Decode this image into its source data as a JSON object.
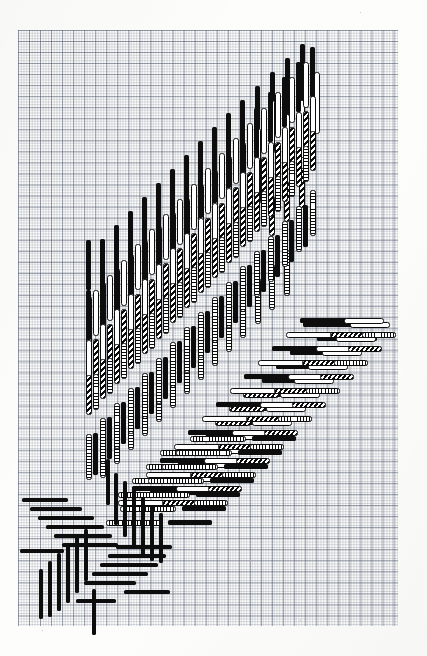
{
  "figure": {
    "title": "",
    "media": "graph-paper-scan",
    "background_color": "#fdfdfc",
    "grid": {
      "major_line_color": "#46506480",
      "minor_line_color": "#5a6478",
      "major_cell_px": 11.05,
      "minor_cell_px": 2.76,
      "left": 18,
      "top": 30,
      "width": 380,
      "height": 596,
      "cols_major": 34,
      "rows_major": 54
    },
    "ink_color": "#0d0d0d",
    "fill_styles": [
      {
        "id": "f-solid",
        "name": "solid-black"
      },
      {
        "id": "f-hollow",
        "name": "hollow-outline"
      },
      {
        "id": "f-hatch",
        "name": "diagonal-hatched"
      },
      {
        "id": "f-seg-v",
        "name": "segmented-ladder-vertical"
      },
      {
        "id": "f-seg-h",
        "name": "segmented-ladder-horizontal"
      }
    ]
  },
  "chart_data": {
    "type": "bar",
    "title": "",
    "subtitle": "",
    "xlabel": "",
    "ylabel": "",
    "grid": true,
    "legend": "none",
    "xlim": [
      18,
      398
    ],
    "ylim": [
      30,
      626
    ],
    "bars": [
      {
        "x": 300,
        "y": 44,
        "w": 5,
        "h": 78,
        "s": "f-solid",
        "o": "v"
      },
      {
        "x": 285,
        "y": 58,
        "w": 5,
        "h": 74,
        "s": "f-solid",
        "o": "v"
      },
      {
        "x": 270,
        "y": 72,
        "w": 5,
        "h": 70,
        "s": "f-solid",
        "o": "v"
      },
      {
        "x": 255,
        "y": 86,
        "w": 5,
        "h": 66,
        "s": "f-solid",
        "o": "v"
      },
      {
        "x": 240,
        "y": 100,
        "w": 5,
        "h": 62,
        "s": "f-solid",
        "o": "v"
      },
      {
        "x": 226,
        "y": 113,
        "w": 5,
        "h": 60,
        "s": "f-solid",
        "o": "v"
      },
      {
        "x": 212,
        "y": 127,
        "w": 5,
        "h": 58,
        "s": "f-solid",
        "o": "v"
      },
      {
        "x": 198,
        "y": 141,
        "w": 5,
        "h": 56,
        "s": "f-solid",
        "o": "v"
      },
      {
        "x": 184,
        "y": 155,
        "w": 5,
        "h": 54,
        "s": "f-solid",
        "o": "v"
      },
      {
        "x": 170,
        "y": 169,
        "w": 5,
        "h": 52,
        "s": "f-solid",
        "o": "v"
      },
      {
        "x": 156,
        "y": 183,
        "w": 5,
        "h": 52,
        "s": "f-solid",
        "o": "v"
      },
      {
        "x": 142,
        "y": 197,
        "w": 5,
        "h": 52,
        "s": "f-solid",
        "o": "v"
      },
      {
        "x": 128,
        "y": 211,
        "w": 5,
        "h": 52,
        "s": "f-solid",
        "o": "v"
      },
      {
        "x": 114,
        "y": 225,
        "w": 5,
        "h": 52,
        "s": "f-solid",
        "o": "v"
      },
      {
        "x": 100,
        "y": 239,
        "w": 5,
        "h": 52,
        "s": "f-solid",
        "o": "v"
      },
      {
        "x": 86,
        "y": 240,
        "w": 5,
        "h": 50,
        "s": "f-solid",
        "o": "v"
      },
      {
        "x": 314,
        "y": 72,
        "w": 6,
        "h": 62,
        "s": "f-hollow",
        "o": "v"
      },
      {
        "x": 299,
        "y": 100,
        "w": 6,
        "h": 58,
        "s": "f-hollow",
        "o": "v"
      },
      {
        "x": 284,
        "y": 114,
        "w": 6,
        "h": 56,
        "s": "f-hollow",
        "o": "v"
      },
      {
        "x": 269,
        "y": 100,
        "w": 6,
        "h": 54,
        "s": "f-hollow",
        "o": "v"
      },
      {
        "x": 255,
        "y": 128,
        "w": 6,
        "h": 52,
        "s": "f-hollow",
        "o": "v"
      },
      {
        "x": 240,
        "y": 142,
        "w": 6,
        "h": 50,
        "s": "f-hollow",
        "o": "v"
      },
      {
        "x": 226,
        "y": 156,
        "w": 6,
        "h": 50,
        "s": "f-hollow",
        "o": "v"
      },
      {
        "x": 212,
        "y": 170,
        "w": 6,
        "h": 50,
        "s": "f-hollow",
        "o": "v"
      },
      {
        "x": 198,
        "y": 184,
        "w": 6,
        "h": 50,
        "s": "f-hollow",
        "o": "v"
      },
      {
        "x": 184,
        "y": 198,
        "w": 6,
        "h": 50,
        "s": "f-hollow",
        "o": "v"
      },
      {
        "x": 170,
        "y": 212,
        "w": 6,
        "h": 50,
        "s": "f-hollow",
        "o": "v"
      },
      {
        "x": 156,
        "y": 226,
        "w": 6,
        "h": 50,
        "s": "f-hollow",
        "o": "v"
      },
      {
        "x": 142,
        "y": 240,
        "w": 6,
        "h": 50,
        "s": "f-hollow",
        "o": "v"
      },
      {
        "x": 128,
        "y": 254,
        "w": 6,
        "h": 50,
        "s": "f-hollow",
        "o": "v"
      },
      {
        "x": 114,
        "y": 268,
        "w": 6,
        "h": 50,
        "s": "f-hollow",
        "o": "v"
      },
      {
        "x": 100,
        "y": 282,
        "w": 6,
        "h": 50,
        "s": "f-hollow",
        "o": "v"
      },
      {
        "x": 86,
        "y": 296,
        "w": 6,
        "h": 50,
        "s": "f-hollow",
        "o": "v"
      },
      {
        "x": 299,
        "y": 168,
        "w": 6,
        "h": 40,
        "s": "f-hatch",
        "o": "v"
      },
      {
        "x": 284,
        "y": 182,
        "w": 6,
        "h": 40,
        "s": "f-hatch",
        "o": "v"
      },
      {
        "x": 269,
        "y": 196,
        "w": 6,
        "h": 40,
        "s": "f-hatch",
        "o": "v"
      },
      {
        "x": 255,
        "y": 166,
        "w": 6,
        "h": 38,
        "s": "f-hatch",
        "o": "v"
      },
      {
        "x": 240,
        "y": 180,
        "w": 6,
        "h": 38,
        "s": "f-hatch",
        "o": "v"
      },
      {
        "x": 226,
        "y": 194,
        "w": 6,
        "h": 38,
        "s": "f-hatch",
        "o": "v"
      },
      {
        "x": 212,
        "y": 208,
        "w": 6,
        "h": 38,
        "s": "f-hatch",
        "o": "v"
      },
      {
        "x": 198,
        "y": 222,
        "w": 6,
        "h": 38,
        "s": "f-hatch",
        "o": "v"
      },
      {
        "x": 184,
        "y": 236,
        "w": 6,
        "h": 38,
        "s": "f-hatch",
        "o": "v"
      },
      {
        "x": 170,
        "y": 250,
        "w": 6,
        "h": 38,
        "s": "f-hatch",
        "o": "v"
      },
      {
        "x": 156,
        "y": 264,
        "w": 6,
        "h": 38,
        "s": "f-hatch",
        "o": "v"
      },
      {
        "x": 142,
        "y": 278,
        "w": 6,
        "h": 38,
        "s": "f-hatch",
        "o": "v"
      },
      {
        "x": 128,
        "y": 292,
        "w": 6,
        "h": 38,
        "s": "f-hatch",
        "o": "v"
      },
      {
        "x": 114,
        "y": 306,
        "w": 6,
        "h": 38,
        "s": "f-hatch",
        "o": "v"
      },
      {
        "x": 284,
        "y": 250,
        "w": 6,
        "h": 46,
        "s": "f-seg-v",
        "o": "v"
      },
      {
        "x": 269,
        "y": 264,
        "w": 6,
        "h": 46,
        "s": "f-seg-v",
        "o": "v"
      },
      {
        "x": 255,
        "y": 278,
        "w": 6,
        "h": 46,
        "s": "f-seg-v",
        "o": "v"
      },
      {
        "x": 240,
        "y": 292,
        "w": 6,
        "h": 46,
        "s": "f-seg-v",
        "o": "v"
      },
      {
        "x": 226,
        "y": 306,
        "w": 6,
        "h": 46,
        "s": "f-seg-v",
        "o": "v"
      },
      {
        "x": 212,
        "y": 320,
        "w": 6,
        "h": 46,
        "s": "f-seg-v",
        "o": "v"
      },
      {
        "x": 198,
        "y": 334,
        "w": 6,
        "h": 46,
        "s": "f-seg-v",
        "o": "v"
      },
      {
        "x": 184,
        "y": 348,
        "w": 6,
        "h": 46,
        "s": "f-seg-v",
        "o": "v"
      },
      {
        "x": 170,
        "y": 362,
        "w": 6,
        "h": 46,
        "s": "f-seg-v",
        "o": "v"
      },
      {
        "x": 156,
        "y": 376,
        "w": 6,
        "h": 46,
        "s": "f-seg-v",
        "o": "v"
      },
      {
        "x": 142,
        "y": 390,
        "w": 6,
        "h": 46,
        "s": "f-seg-v",
        "o": "v"
      },
      {
        "x": 128,
        "y": 404,
        "w": 6,
        "h": 46,
        "s": "f-seg-v",
        "o": "v"
      },
      {
        "x": 114,
        "y": 418,
        "w": 6,
        "h": 46,
        "s": "f-seg-v",
        "o": "v"
      },
      {
        "x": 100,
        "y": 432,
        "w": 6,
        "h": 46,
        "s": "f-seg-v",
        "o": "v"
      },
      {
        "x": 303,
        "y": 322,
        "w": 62,
        "h": 5,
        "s": "f-solid",
        "o": "h"
      },
      {
        "x": 317,
        "y": 336,
        "w": 60,
        "h": 5,
        "s": "f-solid",
        "o": "h"
      },
      {
        "x": 290,
        "y": 350,
        "w": 56,
        "h": 5,
        "s": "f-solid",
        "o": "h"
      },
      {
        "x": 276,
        "y": 364,
        "w": 58,
        "h": 5,
        "s": "f-solid",
        "o": "h"
      },
      {
        "x": 262,
        "y": 378,
        "w": 58,
        "h": 5,
        "s": "f-solid",
        "o": "h"
      },
      {
        "x": 248,
        "y": 392,
        "w": 58,
        "h": 5,
        "s": "f-solid",
        "o": "h"
      },
      {
        "x": 234,
        "y": 406,
        "w": 58,
        "h": 5,
        "s": "f-solid",
        "o": "h"
      },
      {
        "x": 220,
        "y": 420,
        "w": 58,
        "h": 5,
        "s": "f-solid",
        "o": "h"
      },
      {
        "x": 206,
        "y": 434,
        "w": 58,
        "h": 5,
        "s": "f-solid",
        "o": "h"
      },
      {
        "x": 192,
        "y": 448,
        "w": 58,
        "h": 5,
        "s": "f-solid",
        "o": "h"
      },
      {
        "x": 178,
        "y": 462,
        "w": 58,
        "h": 5,
        "s": "f-solid",
        "o": "h"
      },
      {
        "x": 164,
        "y": 476,
        "w": 58,
        "h": 5,
        "s": "f-solid",
        "o": "h"
      },
      {
        "x": 150,
        "y": 490,
        "w": 58,
        "h": 5,
        "s": "f-solid",
        "o": "h"
      },
      {
        "x": 350,
        "y": 322,
        "w": 40,
        "h": 6,
        "s": "f-hollow",
        "o": "h"
      },
      {
        "x": 336,
        "y": 336,
        "w": 40,
        "h": 6,
        "s": "f-hollow",
        "o": "h"
      },
      {
        "x": 322,
        "y": 350,
        "w": 40,
        "h": 6,
        "s": "f-hollow",
        "o": "h"
      },
      {
        "x": 308,
        "y": 364,
        "w": 40,
        "h": 6,
        "s": "f-hollow",
        "o": "h"
      },
      {
        "x": 294,
        "y": 378,
        "w": 40,
        "h": 6,
        "s": "f-hollow",
        "o": "h"
      },
      {
        "x": 280,
        "y": 392,
        "w": 40,
        "h": 6,
        "s": "f-hollow",
        "o": "h"
      },
      {
        "x": 266,
        "y": 406,
        "w": 40,
        "h": 6,
        "s": "f-hollow",
        "o": "h"
      },
      {
        "x": 252,
        "y": 420,
        "w": 40,
        "h": 6,
        "s": "f-hollow",
        "o": "h"
      },
      {
        "x": 238,
        "y": 434,
        "w": 40,
        "h": 6,
        "s": "f-hollow",
        "o": "h"
      },
      {
        "x": 224,
        "y": 448,
        "w": 40,
        "h": 6,
        "s": "f-hollow",
        "o": "h"
      },
      {
        "x": 210,
        "y": 462,
        "w": 40,
        "h": 6,
        "s": "f-hollow",
        "o": "h"
      },
      {
        "x": 196,
        "y": 476,
        "w": 40,
        "h": 6,
        "s": "f-hollow",
        "o": "h"
      },
      {
        "x": 160,
        "y": 450,
        "w": 54,
        "h": 6,
        "s": "f-seg-h",
        "o": "h"
      },
      {
        "x": 146,
        "y": 464,
        "w": 54,
        "h": 6,
        "s": "f-seg-h",
        "o": "h"
      },
      {
        "x": 132,
        "y": 478,
        "w": 54,
        "h": 6,
        "s": "f-seg-h",
        "o": "h"
      },
      {
        "x": 118,
        "y": 492,
        "w": 54,
        "h": 6,
        "s": "f-seg-h",
        "o": "h"
      },
      {
        "x": 243,
        "y": 392,
        "w": 36,
        "h": 6,
        "s": "f-hatch",
        "o": "h"
      },
      {
        "x": 229,
        "y": 406,
        "w": 36,
        "h": 6,
        "s": "f-hatch",
        "o": "h"
      },
      {
        "x": 215,
        "y": 420,
        "w": 36,
        "h": 6,
        "s": "f-hatch",
        "o": "h"
      }
    ],
    "star": {
      "center_x": 100,
      "center_y": 545,
      "arms": 4,
      "description": "pinwheel of four stepped arms of solid black bars"
    }
  }
}
